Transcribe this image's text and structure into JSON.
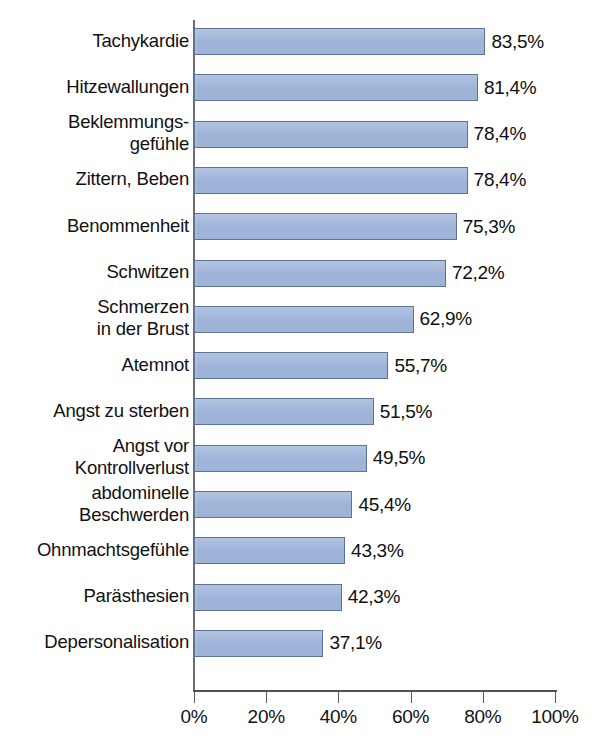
{
  "chart_data": {
    "type": "bar",
    "orientation": "horizontal",
    "title": "",
    "subtitle": "",
    "xlabel": "",
    "ylabel": "",
    "xlim": [
      0,
      100
    ],
    "grid": false,
    "legend": null,
    "axis": {
      "tick_labels": [
        "0%",
        "20%",
        "40%",
        "60%",
        "80%",
        "100%"
      ],
      "tick_values": [
        0,
        20,
        40,
        60,
        80,
        100
      ]
    },
    "bar_color": "#9db3d8",
    "bar_border_color": "#5f7196",
    "categories": [
      "Tachykardie",
      "Hitzewallungen",
      "Beklemmungs-\ngefühle",
      "Zittern, Beben",
      "Benommenheit",
      "Schwitzen",
      "Schmerzen\nin der Brust",
      "Atemnot",
      "Angst zu sterben",
      "Angst vor\nKontrollverlust",
      "abdominelle\nBeschwerden",
      "Ohnmachtsgefühle",
      "Parästhesien",
      "Depersonalisation"
    ],
    "values": [
      83.5,
      81.4,
      78.4,
      78.4,
      75.3,
      72.2,
      62.9,
      55.7,
      51.5,
      49.5,
      45.4,
      43.3,
      42.3,
      37.1
    ],
    "value_labels": [
      "83,5%",
      "81,4%",
      "78,4%",
      "78,4%",
      "75,3%",
      "72,2%",
      "62,9%",
      "55,7%",
      "51,5%",
      "49,5%",
      "45,4%",
      "43,3%",
      "42,3%",
      "37,1%"
    ]
  }
}
